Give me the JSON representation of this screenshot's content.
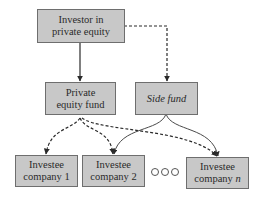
{
  "diagram": {
    "nodes": {
      "investor": {
        "line1": "Investor in",
        "line2": "private equity"
      },
      "pe_fund": {
        "line1": "Private",
        "line2": "equity fund"
      },
      "side_fund": {
        "label": "Side fund"
      },
      "investee_1": {
        "line1": "Investee",
        "line2": "company 1"
      },
      "investee_2": {
        "line1": "Investee",
        "line2": "company 2"
      },
      "investee_n": {
        "line1": "Investee",
        "line2": "company ",
        "line2_italic": "n"
      }
    },
    "ellipsis": "○○○",
    "edges": [
      {
        "from": "investor",
        "to": "pe_fund",
        "style": "solid"
      },
      {
        "from": "investor",
        "to": "side_fund",
        "style": "dashed"
      },
      {
        "from": "pe_fund",
        "to": "investee_1",
        "style": "dashed"
      },
      {
        "from": "pe_fund",
        "to": "investee_2",
        "style": "dashed"
      },
      {
        "from": "pe_fund",
        "to": "investee_n",
        "style": "dashed"
      },
      {
        "from": "side_fund",
        "to": "investee_2",
        "style": "solid-curve"
      },
      {
        "from": "side_fund",
        "to": "investee_n",
        "style": "solid-curve"
      }
    ],
    "colors": {
      "box_fill": "#c8c8c8",
      "box_border": "#6e6e6e",
      "line": "#2a2a2a"
    }
  }
}
